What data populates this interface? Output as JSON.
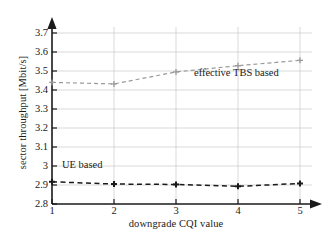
{
  "chart_data": {
    "type": "line",
    "title": "",
    "xlabel": "downgrade CQI value",
    "ylabel": "sector throughput [Mbit/s]",
    "xlim": [
      1,
      5
    ],
    "ylim": [
      2.8,
      3.7
    ],
    "xticks": [
      "1",
      "2",
      "3",
      "4",
      "5"
    ],
    "yticks": [
      "2.8",
      "2.9",
      "3",
      "3.1",
      "3.2",
      "3.3",
      "3.4",
      "3.5",
      "3.6",
      "3.7"
    ],
    "grid": true,
    "grid_color": "#c9c9c9",
    "axis_color": "#1a1a1a",
    "legend_position": "inline-annotations",
    "x": [
      1,
      2,
      3,
      4,
      5
    ],
    "series": [
      {
        "name": "effective TBS based",
        "values": [
          3.44,
          3.432,
          3.495,
          3.528,
          3.556
        ],
        "color": "#9a9a9a",
        "style": "dashed",
        "marker": "cross"
      },
      {
        "name": "UE based",
        "values": [
          2.917,
          2.905,
          2.903,
          2.893,
          2.908
        ],
        "color": "#1a1a1a",
        "style": "dashed",
        "marker": "cross"
      }
    ],
    "annotations": [
      {
        "text": "effective TBS based",
        "x": 3.35,
        "y": 3.485
      },
      {
        "text": "UE based",
        "x": 1.2,
        "y": 3.0
      }
    ]
  }
}
